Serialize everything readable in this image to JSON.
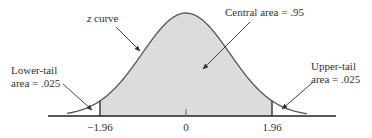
{
  "diagram": {
    "type": "normal-distribution",
    "curve_label_var": "z",
    "curve_label_rest": " curve",
    "annotations": {
      "central": "Central area = .95",
      "lower_line1": "Lower-tail",
      "lower_line2": "area = .025",
      "upper_line1": "Upper-tail",
      "upper_line2": "area = .025"
    },
    "axis_ticks": [
      "−1.96",
      "0",
      "1.96"
    ],
    "critical_values": [
      -1.96,
      1.96
    ],
    "central_area": 0.95,
    "lower_tail_area": 0.025,
    "upper_tail_area": 0.025,
    "colors": {
      "shade": "#dcdcdc",
      "curve": "#555555",
      "axis": "#222222",
      "text": "#333333"
    }
  }
}
